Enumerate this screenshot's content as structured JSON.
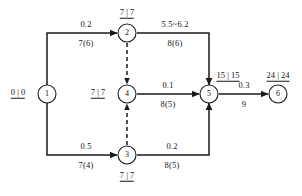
{
  "diagram": {
    "nodes": [
      {
        "id": "1",
        "label": "1",
        "time_label": "0 | 0",
        "time_pos": "left"
      },
      {
        "id": "2",
        "label": "2",
        "time_label": "7 | 7",
        "time_pos": "above"
      },
      {
        "id": "3",
        "label": "3",
        "time_label": "7 | 7",
        "time_pos": "below"
      },
      {
        "id": "4",
        "label": "4",
        "time_label": "7 | 7",
        "time_pos": "left"
      },
      {
        "id": "5",
        "label": "5",
        "time_label": "15 | 15",
        "time_pos": "above-right"
      },
      {
        "id": "6",
        "label": "6",
        "time_label": "24 | 24",
        "time_pos": "above"
      }
    ],
    "edges": [
      {
        "from": "1",
        "to": "2",
        "upper": "0.2",
        "lower": "7(6)",
        "style": "solid"
      },
      {
        "from": "2",
        "to": "5",
        "upper": "5.5~6.2",
        "lower": "8(6)",
        "style": "solid"
      },
      {
        "from": "4",
        "to": "5",
        "upper": "0.1",
        "lower": "8(5)",
        "style": "solid"
      },
      {
        "from": "1",
        "to": "3",
        "upper": "0.5",
        "lower": "7(4)",
        "style": "solid"
      },
      {
        "from": "3",
        "to": "5",
        "upper": "0.2",
        "lower": "8(5)",
        "style": "solid"
      },
      {
        "from": "5",
        "to": "6",
        "upper": "0.3",
        "lower": "9",
        "style": "solid"
      },
      {
        "from": "2",
        "to": "4",
        "upper": "",
        "lower": "",
        "style": "dashed"
      },
      {
        "from": "3",
        "to": "4",
        "upper": "",
        "lower": "",
        "style": "dashed"
      }
    ]
  },
  "colors": {
    "ink": "#151515",
    "paper": "#ffffff"
  }
}
